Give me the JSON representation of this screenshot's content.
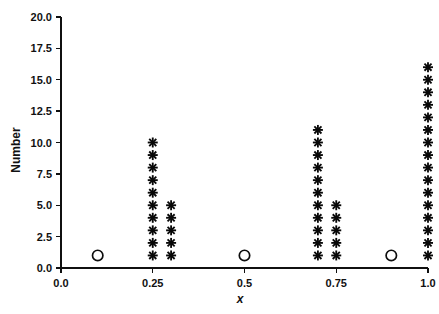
{
  "chart_data": {
    "type": "scatter",
    "title": "",
    "xlabel": "x",
    "ylabel": "Number",
    "xlim": [
      0.0,
      1.0
    ],
    "ylim": [
      0.0,
      20.0
    ],
    "grid": false,
    "legend": "none",
    "x_ticks": [
      0.0,
      0.25,
      0.5,
      0.75,
      1.0
    ],
    "x_tick_labels": [
      "0.0",
      "0.25",
      "0.5",
      "0.75",
      "1.0"
    ],
    "y_ticks": [
      0.0,
      2.5,
      5.0,
      7.5,
      10.0,
      12.5,
      15.0,
      17.5,
      20.0
    ],
    "y_tick_labels": [
      "0.0",
      "2.5",
      "5.0",
      "7.5",
      "10.0",
      "12.5",
      "15.0",
      "17.5",
      "20.0"
    ],
    "series": [
      {
        "name": "open-circle-points",
        "marker": "open-circle",
        "points": [
          {
            "x": 0.1,
            "y": 1
          },
          {
            "x": 0.5,
            "y": 1
          },
          {
            "x": 0.9,
            "y": 1
          }
        ]
      },
      {
        "name": "asterisk-points",
        "marker": "asterisk",
        "columns": [
          {
            "x": 0.25,
            "count": 10,
            "y_values": [
              1,
              2,
              3,
              4,
              5,
              6,
              7,
              8,
              9,
              10
            ]
          },
          {
            "x": 0.3,
            "count": 5,
            "y_values": [
              1,
              2,
              3,
              4,
              5
            ]
          },
          {
            "x": 0.7,
            "count": 11,
            "y_values": [
              1,
              2,
              3,
              4,
              5,
              6,
              7,
              8,
              9,
              10,
              11
            ]
          },
          {
            "x": 0.75,
            "count": 5,
            "y_values": [
              1,
              2,
              3,
              4,
              5
            ]
          },
          {
            "x": 1.0,
            "count": 16,
            "y_values": [
              1,
              2,
              3,
              4,
              5,
              6,
              7,
              8,
              9,
              10,
              11,
              12,
              13,
              14,
              15,
              16
            ]
          }
        ]
      }
    ],
    "colors": {
      "marker": "#080808",
      "axis": "#101010",
      "background": "#ffffff"
    }
  },
  "figure": {
    "y_axis_title": "Number",
    "x_axis_title": "x"
  }
}
